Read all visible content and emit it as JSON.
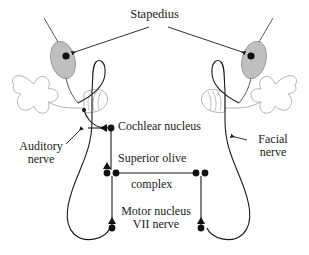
{
  "diagram": {
    "title": "Stapedius",
    "background_color": "#ffffff",
    "ink_color": "#1a1a1a",
    "ear_outline_color": "#b4b4b4",
    "muscle_fill_color": "#bfbfbf",
    "muscle_stroke_color": "#8c8c8c"
  },
  "labels": {
    "stapedius": "Stapedius",
    "cochlear_nucleus": "Cochlear nucleus",
    "auditory_nerve_line1": "Auditory",
    "auditory_nerve_line2": "nerve",
    "facial_nerve_line1": "Facial",
    "facial_nerve_line2": "nerve",
    "superior_olive": "Superior olive",
    "superior_olive_line2": "complex",
    "motor_nucleus_line1": "Motor nucleus",
    "motor_nucleus_line2": "VII nerve"
  },
  "structures": {
    "left_ear": {
      "name": "left ear",
      "stapedius_muscle": {
        "cx": 63,
        "cy": 60,
        "rx": 12,
        "ry": 19,
        "rotate": -14
      },
      "cochlea": {
        "cx": 88,
        "cy": 101
      },
      "pinna": {
        "cx": 40,
        "cy": 93
      }
    },
    "right_ear": {
      "name": "right ear",
      "stapedius_muscle": {
        "cx": 254,
        "cy": 60,
        "rx": 12,
        "ry": 19,
        "rotate": 14
      },
      "cochlea": {
        "cx": 229,
        "cy": 101
      },
      "pinna": {
        "cx": 272,
        "cy": 93
      }
    }
  },
  "nodes": [
    {
      "name": "left-stapedius-terminal",
      "x": 66,
      "y": 56,
      "marker": "dot"
    },
    {
      "name": "right-stapedius-terminal",
      "x": 251,
      "y": 56,
      "marker": "dot"
    },
    {
      "name": "left-cochlear-nucleus",
      "x": 111,
      "y": 128,
      "marker": "dot-with-left-arrow"
    },
    {
      "name": "left-superior-olive-a",
      "x": 107,
      "y": 173,
      "marker": "dot-with-up-arrow"
    },
    {
      "name": "left-superior-olive-b",
      "x": 116,
      "y": 173,
      "marker": "dot"
    },
    {
      "name": "right-superior-olive-a",
      "x": 196,
      "y": 173,
      "marker": "dot"
    },
    {
      "name": "right-superior-olive-b",
      "x": 205,
      "y": 173,
      "marker": "dot"
    },
    {
      "name": "left-motor-nucleus-VII",
      "x": 112,
      "y": 228,
      "marker": "dot-with-up-arrow"
    },
    {
      "name": "right-motor-nucleus-VII",
      "x": 201,
      "y": 228,
      "marker": "dot-with-up-arrow"
    }
  ],
  "pathways": [
    {
      "name": "left-auditory-afferent",
      "from": "left cochlea",
      "to": "left cochlear nucleus"
    },
    {
      "name": "left-cochlear-to-olive",
      "from": "left cochlear nucleus",
      "to": "left superior olive complex"
    },
    {
      "name": "olive-commissure",
      "from": "left superior olive complex",
      "to": "right superior olive complex"
    },
    {
      "name": "left-olive-to-motor",
      "from": "left superior olive complex",
      "to": "left motor nucleus VII"
    },
    {
      "name": "right-olive-to-motor",
      "from": "right superior olive complex",
      "to": "right motor nucleus VII"
    },
    {
      "name": "left-facial-efferent",
      "from": "left motor nucleus VII",
      "to": "left stapedius muscle"
    },
    {
      "name": "right-facial-efferent",
      "from": "right motor nucleus VII",
      "to": "right stapedius muscle"
    },
    {
      "name": "stapedius-leader-left",
      "from": "Stapedius label",
      "to": "left stapedius muscle"
    },
    {
      "name": "stapedius-leader-right",
      "from": "Stapedius label",
      "to": "right stapedius muscle"
    },
    {
      "name": "auditory-nerve-leader",
      "from": "Auditory nerve label",
      "to": "left auditory nerve"
    },
    {
      "name": "facial-nerve-leader",
      "from": "Facial nerve label",
      "to": "right facial nerve"
    }
  ]
}
